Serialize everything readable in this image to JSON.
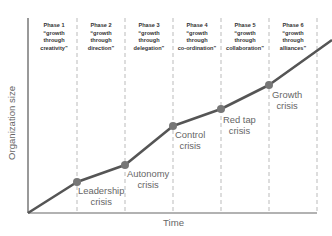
{
  "diagram": {
    "title": "",
    "y_axis_label": "Organization size",
    "x_axis_label": "Time",
    "colors": {
      "line": "#555555",
      "point": "#777777",
      "axis": "#555555",
      "divider": "#bbbbbb",
      "phase_text": "#333333",
      "crisis_text": "#666666"
    },
    "phases": [
      {
        "label": "Phase 1",
        "quote_line1": "“growth",
        "quote_line2": "through",
        "quote_line3": "creativity”"
      },
      {
        "label": "Phase 2",
        "quote_line1": "“growth",
        "quote_line2": "through",
        "quote_line3": "direction”"
      },
      {
        "label": "Phase 3",
        "quote_line1": "“growth",
        "quote_line2": "through",
        "quote_line3": "delegation”"
      },
      {
        "label": "Phase 4",
        "quote_line1": "“growth",
        "quote_line2": "through",
        "quote_line3": "co-ordination”"
      },
      {
        "label": "Phase 5",
        "quote_line1": "“growth",
        "quote_line2": "through",
        "quote_line3": "collaboration”"
      },
      {
        "label": "Phase 6",
        "quote_line1": "“growth",
        "quote_line2": "through",
        "quote_line3": "alliances”"
      }
    ],
    "crises": [
      {
        "line1": "Leadership",
        "line2": "crisis"
      },
      {
        "line1": "Autonomy",
        "line2": "crisis"
      },
      {
        "line1": "Control",
        "line2": "crisis"
      },
      {
        "line1": "Red tap",
        "line2": "crisis"
      },
      {
        "line1": "Growth",
        "line2": "crisis"
      }
    ]
  }
}
